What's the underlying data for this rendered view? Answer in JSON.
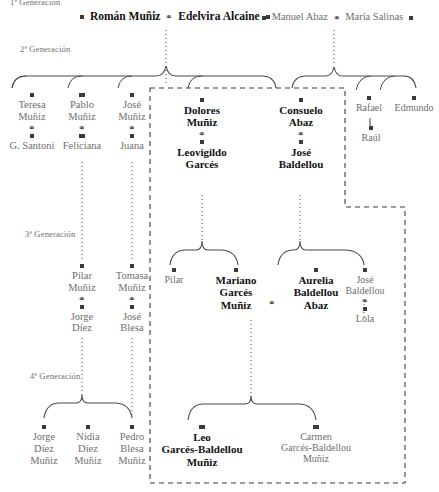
{
  "diagram": {
    "title_partial": "1ª Generación",
    "marriage_symbol": "⚭",
    "colors": {
      "bold_text": "#111111",
      "grey_text": "#6e6e6e",
      "marker": "#3a3a3a",
      "line": "#3a3a3a",
      "box_dash": "#3a3a3a",
      "background": "#ffffff"
    },
    "generation_labels": [
      {
        "id": "gen1",
        "text": "1ª Generación"
      },
      {
        "id": "gen2",
        "text": "2ª Generación"
      },
      {
        "id": "gen3",
        "text": "3ª Generación"
      },
      {
        "id": "gen4",
        "text": "4ª Generación"
      }
    ],
    "generation1": {
      "couple_left": {
        "spouse1": "Román Muñiz",
        "spouse2": "Edelvira Alcaine",
        "emphasis": "bold"
      },
      "couple_right": {
        "spouse1": "Manuel Abaz",
        "spouse2": "María Salinas",
        "emphasis": "grey"
      }
    },
    "generation2": {
      "left_children": [
        {
          "name_line1": "Teresa",
          "name_line2": "Muñiz",
          "spouse": "G. Santoni",
          "emphasis": "grey"
        },
        {
          "name_line1": "Pablo",
          "name_line2": "Muñiz",
          "spouse": "Feliciana",
          "emphasis": "grey"
        },
        {
          "name_line1": "José",
          "name_line2": "Muñiz",
          "spouse": "Juana",
          "emphasis": "grey"
        }
      ],
      "boxed_couples": [
        {
          "name_line1": "Dolores",
          "name_line2": "Muñiz",
          "spouse_line1": "Leovigildo",
          "spouse_line2": "Garcés",
          "emphasis": "bold"
        },
        {
          "name_line1": "Consuelo",
          "name_line2": "Abaz",
          "spouse_line1": "José",
          "spouse_line2": "Baldellou",
          "emphasis": "bold"
        }
      ],
      "right_children": [
        {
          "name": "Rafael",
          "emphasis": "grey"
        },
        {
          "name": "Edmundo",
          "emphasis": "grey"
        }
      ],
      "right_grandchild": {
        "name": "Raúl",
        "emphasis": "grey"
      }
    },
    "generation3": {
      "left_couples": [
        {
          "name_line1": "Pilar",
          "name_line2": "Muñiz",
          "spouse_line1": "Jorge",
          "spouse_line2": "Díez",
          "emphasis": "grey"
        },
        {
          "name_line1": "Tomasa",
          "name_line2": "Muñiz",
          "spouse_line1": "José",
          "spouse_line2": "Blesa",
          "emphasis": "grey"
        }
      ],
      "boxed": {
        "single_left": {
          "name": "Pilar",
          "emphasis": "grey"
        },
        "couple": {
          "spouse1_line1": "Mariano",
          "spouse1_line2": "Garcés",
          "spouse1_line3": "Muñiz",
          "spouse2_line1": "Aurelia",
          "spouse2_line2": "Baldellou",
          "spouse2_line3": "Abaz",
          "emphasis": "bold"
        },
        "right_couple": {
          "name_line1": "José",
          "name_line2": "Baldellou",
          "spouse": "Lola",
          "emphasis": "grey"
        }
      }
    },
    "generation4": {
      "left_children": [
        {
          "line1": "Jorge",
          "line2": "Díez",
          "line3": "Muñiz",
          "emphasis": "grey"
        },
        {
          "line1": "Nidia",
          "line2": "Díez",
          "line3": "Muñiz",
          "emphasis": "grey"
        },
        {
          "line1": "Pedro",
          "line2": "Blesa",
          "line3": "Muñiz",
          "emphasis": "grey"
        }
      ],
      "boxed_children": [
        {
          "line1": "Leo",
          "line2": "Garcés-Baldellou",
          "line3": "Muñiz",
          "emphasis": "bold"
        },
        {
          "line1": "Carmen",
          "line2": "Garcés-Baldellou",
          "line3": "Muñiz",
          "emphasis": "grey"
        }
      ]
    }
  }
}
